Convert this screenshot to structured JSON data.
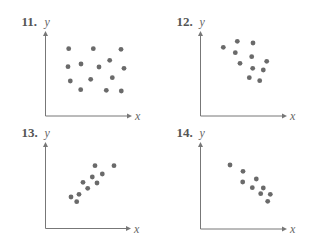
{
  "colors": {
    "background": "#ffffff",
    "axis": "#777777",
    "dot": "#6a6a6a",
    "label": "#555555"
  },
  "chart_data": [
    {
      "type": "scatter",
      "title": "11.",
      "xlabel": "x",
      "ylabel": "y",
      "grid": false,
      "legend": false,
      "frame": {
        "origin": [
          45.5,
          116
        ],
        "x_end": 132,
        "y_top": 31
      },
      "points": [
        [
          68.7,
          48.7
        ],
        [
          93.3,
          48.7
        ],
        [
          121,
          49.3
        ],
        [
          68,
          66.7
        ],
        [
          81,
          64
        ],
        [
          99,
          67
        ],
        [
          109.7,
          60.3
        ],
        [
          124,
          68.3
        ],
        [
          70.3,
          81
        ],
        [
          90.7,
          79.3
        ],
        [
          112.3,
          77.7
        ],
        [
          80.7,
          89.7
        ],
        [
          106.3,
          90.3
        ],
        [
          121.3,
          91
        ]
      ],
      "note": "Pixel coordinates; no correlation pattern (random scatter)"
    },
    {
      "type": "scatter",
      "title": "12.",
      "xlabel": "x",
      "ylabel": "y",
      "grid": false,
      "legend": false,
      "frame": {
        "origin": [
          200.5,
          116
        ],
        "x_end": 287,
        "y_top": 31
      },
      "points": [
        [
          223.3,
          47.3
        ],
        [
          237.3,
          41.3
        ],
        [
          253,
          43
        ],
        [
          235.3,
          52.7
        ],
        [
          251.7,
          56.7
        ],
        [
          240,
          63.3
        ],
        [
          266.7,
          61.3
        ],
        [
          252.7,
          68.3
        ],
        [
          263.3,
          70
        ],
        [
          249.3,
          77.7
        ],
        [
          259.7,
          80.7
        ]
      ],
      "note": "Pixel coordinates; weak negative correlation"
    },
    {
      "type": "scatter",
      "title": "13.",
      "xlabel": "x",
      "ylabel": "y",
      "grid": false,
      "legend": false,
      "frame": {
        "origin": [
          45.5,
          228.5
        ],
        "x_end": 131,
        "y_top": 142
      },
      "points": [
        [
          71,
          197
        ],
        [
          76.7,
          201.7
        ],
        [
          79,
          194.3
        ],
        [
          83,
          182.3
        ],
        [
          87.7,
          188.3
        ],
        [
          92.3,
          177
        ],
        [
          95,
          165.7
        ],
        [
          97,
          183
        ],
        [
          102.3,
          174
        ],
        [
          114,
          165.7
        ]
      ],
      "note": "Pixel coordinates; positive correlation"
    },
    {
      "type": "scatter",
      "title": "14.",
      "xlabel": "x",
      "ylabel": "y",
      "grid": false,
      "legend": false,
      "frame": {
        "origin": [
          200.5,
          229
        ],
        "x_end": 287,
        "y_top": 142
      },
      "points": [
        [
          230,
          165
        ],
        [
          243,
          171.3
        ],
        [
          242.7,
          182
        ],
        [
          256.3,
          179
        ],
        [
          252.3,
          187.7
        ],
        [
          263.3,
          188
        ],
        [
          260.7,
          193.7
        ],
        [
          270.3,
          194.3
        ],
        [
          267.7,
          201.3
        ]
      ],
      "note": "Pixel coordinates; strong negative correlation"
    }
  ]
}
